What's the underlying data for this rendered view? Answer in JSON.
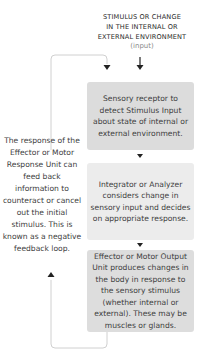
{
  "header": {
    "title_lines": [
      "STIMULUS OR CHANGE",
      "IN THE INTERNAL OR",
      "EXTERNAL ENVIRONMENT"
    ],
    "input_label": "(input)"
  },
  "steps": [
    {
      "label": "Sensory receptor to detect Stimulus Input about state of internal or external environment."
    },
    {
      "label": "Integrator or Analyzer considers change in sensory input and decides on appropriate response."
    },
    {
      "label": "Effector or Motor Output Unit produces changes in the body in response to the sensory stimulus (whether internal or external). These may be muscles or glands."
    }
  ],
  "feedback_note": "The response of the Effector or Motor Response Unit can feed back information to counteract or cancel out the initial stimulus. This is known as a negative feedback loop.",
  "colors": {
    "box_dark": "#dcdcdc",
    "box_light": "#ececec",
    "loop_line": "#d0d0d0",
    "arrow": "#222222"
  }
}
